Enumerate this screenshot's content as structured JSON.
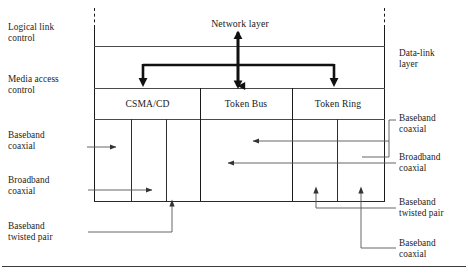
{
  "diagram": {
    "title_center": "Network layer",
    "left_labels": [
      {
        "text": "Logical link\ncontrol",
        "name": "label-logical-link-control"
      },
      {
        "text": "Media access\ncontrol",
        "name": "label-media-access-control"
      },
      {
        "text": "Baseband\ncoaxial",
        "name": "label-left-baseband-coaxial"
      },
      {
        "text": "Broadband\ncoaxial",
        "name": "label-left-broadband-coaxial"
      },
      {
        "text": "Baseband\ntwisted pair",
        "name": "label-left-baseband-twisted-pair"
      }
    ],
    "right_labels": [
      {
        "text": "Data-link\nlayer",
        "name": "label-data-link-layer"
      },
      {
        "text": "Baseband\ncoaxial",
        "name": "label-right-baseband-coaxial-top"
      },
      {
        "text": "Broadband\ncoaxial",
        "name": "label-right-broadband-coaxial"
      },
      {
        "text": "Baseband\ntwisted pair",
        "name": "label-right-baseband-twisted-pair"
      },
      {
        "text": "Baseband\ncoaxial",
        "name": "label-right-baseband-coaxial-bottom"
      }
    ],
    "protocol_cells": [
      {
        "label": "CSMA/CD",
        "sub_cells": 3
      },
      {
        "label": "Token Bus",
        "sub_cells": 1
      },
      {
        "label": "Token Ring",
        "sub_cells": 2
      }
    ],
    "colors": {
      "line": "#1a1a1a",
      "line_thin": "#4a4a4a",
      "text": "#1c1c1c",
      "background": "#ffffff"
    }
  }
}
